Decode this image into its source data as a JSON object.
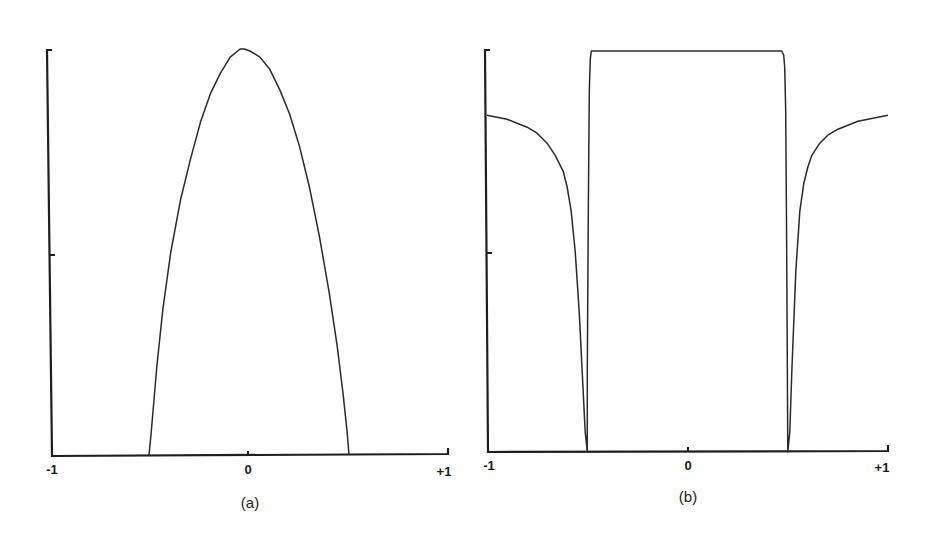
{
  "figure": {
    "panels": [
      {
        "caption": "(a)",
        "x_ticks": [
          "-1",
          "0",
          "+1"
        ]
      },
      {
        "caption": "(b)",
        "x_ticks": [
          "-1",
          "0",
          "+1"
        ]
      }
    ]
  },
  "chart_data": [
    {
      "type": "line",
      "title": "(a)",
      "xlabel": "",
      "ylabel": "",
      "xlim": [
        -1,
        1
      ],
      "ylim": [
        0,
        1
      ],
      "x_tick_labels": [
        "-1",
        "0",
        "+1"
      ],
      "y_ticks_unlabeled": [
        0.5,
        1.0
      ],
      "grid": false,
      "description": "Semi-elliptical / parabolic profile, zero outside |x|>0.5, peak 1.0 at x≈-0.04",
      "series": [
        {
          "name": "profile",
          "x": [
            -0.51,
            -0.5,
            -0.47,
            -0.44,
            -0.4,
            -0.35,
            -0.3,
            -0.25,
            -0.2,
            -0.15,
            -0.1,
            -0.05,
            -0.03,
            0.0,
            0.05,
            0.1,
            0.15,
            0.2,
            0.25,
            0.3,
            0.35,
            0.4,
            0.44,
            0.47,
            0.49,
            0.5
          ],
          "y": [
            0.0,
            0.05,
            0.22,
            0.36,
            0.5,
            0.63,
            0.73,
            0.82,
            0.89,
            0.94,
            0.98,
            1.0,
            1.0,
            0.995,
            0.98,
            0.95,
            0.9,
            0.84,
            0.76,
            0.66,
            0.54,
            0.4,
            0.27,
            0.15,
            0.06,
            0.0
          ]
        }
      ]
    },
    {
      "type": "line",
      "title": "(b)",
      "xlabel": "",
      "ylabel": "",
      "xlim": [
        -1,
        1
      ],
      "ylim": [
        0,
        1
      ],
      "x_tick_labels": [
        "-1",
        "0",
        "+1"
      ],
      "y_ticks_unlabeled": [
        0.5,
        1.0
      ],
      "grid": false,
      "description": "Flat-top plateau of 1.0 for |x|<0.5 with sharp dips to 0 at x=±0.5, recovering toward ~0.84 at |x|=1",
      "series": [
        {
          "name": "profile",
          "x": [
            -1.0,
            -0.95,
            -0.9,
            -0.85,
            -0.8,
            -0.75,
            -0.7,
            -0.66,
            -0.62,
            -0.6,
            -0.58,
            -0.56,
            -0.54,
            -0.52,
            -0.51,
            -0.5,
            -0.5,
            -0.495,
            -0.49,
            -0.485,
            -0.48,
            -0.4,
            -0.2,
            0.0,
            0.2,
            0.4,
            0.47,
            0.48,
            0.485,
            0.49,
            0.495,
            0.5,
            0.5,
            0.51,
            0.52,
            0.54,
            0.56,
            0.58,
            0.6,
            0.62,
            0.66,
            0.7,
            0.75,
            0.8,
            0.85,
            0.9,
            0.95,
            1.0
          ],
          "y": [
            0.84,
            0.835,
            0.83,
            0.82,
            0.81,
            0.795,
            0.77,
            0.74,
            0.7,
            0.66,
            0.6,
            0.5,
            0.35,
            0.15,
            0.05,
            0.0,
            0.2,
            0.6,
            0.9,
            0.98,
            1.0,
            1.0,
            1.0,
            1.0,
            1.0,
            1.0,
            1.0,
            0.99,
            0.96,
            0.85,
            0.5,
            0.0,
            0.0,
            0.05,
            0.2,
            0.45,
            0.6,
            0.67,
            0.71,
            0.74,
            0.77,
            0.79,
            0.805,
            0.815,
            0.825,
            0.83,
            0.835,
            0.84
          ]
        }
      ]
    }
  ]
}
